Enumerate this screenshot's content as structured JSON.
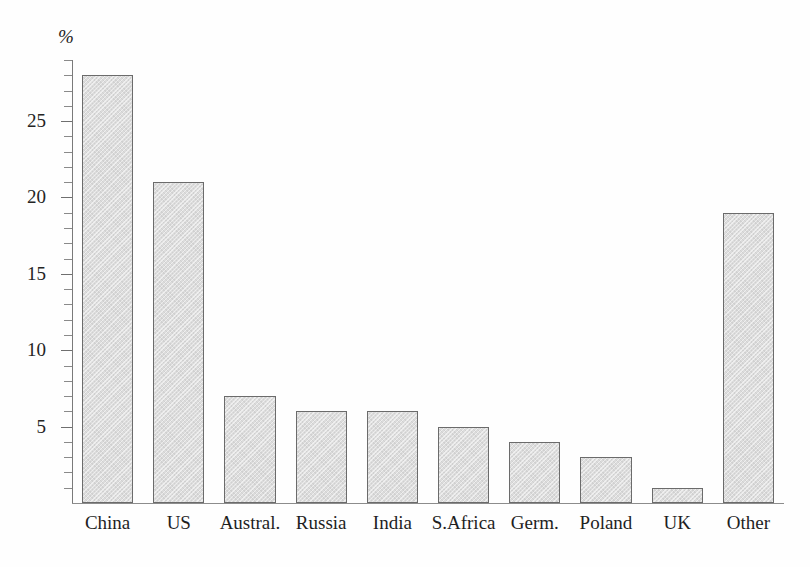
{
  "chart_data": {
    "type": "bar",
    "title": "",
    "subtitle": "",
    "xlabel": "",
    "ylabel": "%",
    "unit_symbol": "%",
    "categories": [
      "China",
      "US",
      "Austral.",
      "Russia",
      "India",
      "S.Africa",
      "Germ.",
      "Poland",
      "UK",
      "Other"
    ],
    "values": [
      28,
      21,
      7,
      6,
      6,
      5,
      4,
      3,
      1,
      19
    ],
    "ylim": [
      0,
      29
    ],
    "y_major_ticks": [
      5,
      10,
      15,
      20,
      25
    ],
    "y_tick_labels": [
      "5",
      "10",
      "15",
      "20",
      "25"
    ],
    "y_minor_tick_step": 1,
    "grid": false,
    "legend": null,
    "annotations": [],
    "colors": {
      "bar_fill": "#dcdcdc",
      "bar_border": "#6b6b6b",
      "axis": "#8a8a8a",
      "text": "#1f1f1f",
      "background": "#fefefe"
    }
  }
}
